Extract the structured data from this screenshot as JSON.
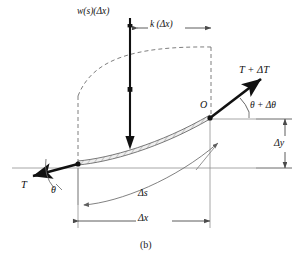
{
  "figure": {
    "caption": "(b)",
    "type": "free-body-diagram",
    "background_color": "#ffffff",
    "ink_color": "#111111",
    "construction_color": "#8a8a8a"
  },
  "labels": {
    "distributed_load": "w(s)(Δx)",
    "spring_load": "k (Δx)",
    "tension_right": "T + ΔT",
    "angle_right": "θ + Δθ",
    "point_o": "O",
    "delta_y": "Δy",
    "tension_left": "T",
    "angle_left": "θ",
    "arc_length": "Δs",
    "delta_x": "Δx"
  },
  "geometry": {
    "left_node": {
      "x": 78,
      "y": 165
    },
    "right_node": {
      "x": 210,
      "y": 119
    },
    "baseline_y": 168,
    "load_arrow": {
      "x": 130,
      "top_y": 18,
      "tip_y": 148
    },
    "dim_k": {
      "y": 28,
      "x_start": 137,
      "x_end": 211
    },
    "dim_dx": {
      "y": 221,
      "x_start": 78,
      "x_end": 210
    },
    "dim_dy": {
      "x": 285,
      "y_start": 119,
      "y_end": 168
    }
  }
}
